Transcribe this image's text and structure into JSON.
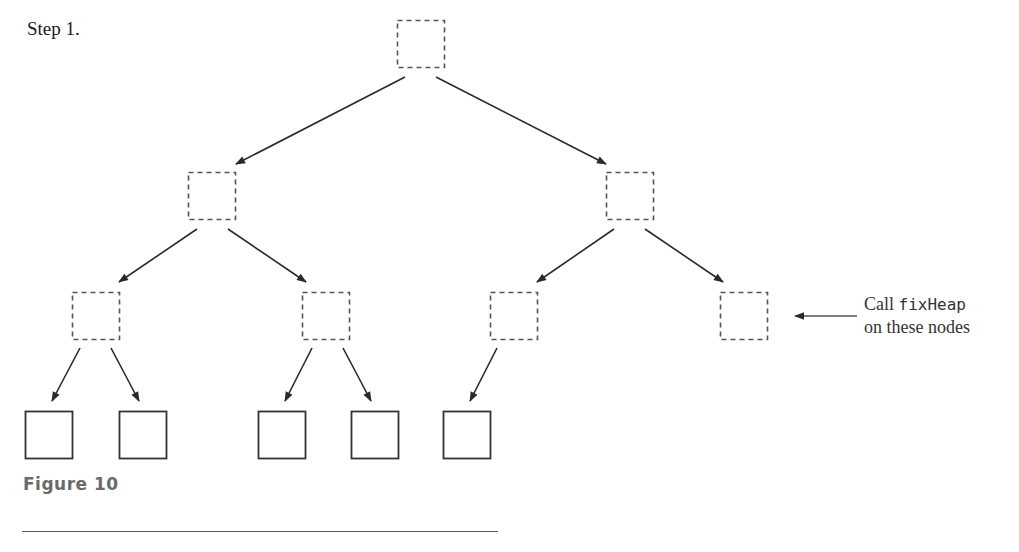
{
  "step": {
    "label": "Step 1."
  },
  "annotation": {
    "line1_prefix": "Call ",
    "line1_code": "fixHeap",
    "line2": "on these nodes"
  },
  "figure": {
    "caption": "Figure 10"
  },
  "colors": {
    "dashed_node_stroke": "#555555",
    "solid_node_stroke": "#333333",
    "arrow": "#2a2a2a",
    "caption_text": "#6a6a6a"
  },
  "tree": {
    "node_size": 47,
    "nodes": [
      {
        "id": "n1",
        "level": 1,
        "x": 397,
        "y": 20,
        "style": "dashed"
      },
      {
        "id": "n2",
        "level": 2,
        "x": 188,
        "y": 172,
        "style": "dashed"
      },
      {
        "id": "n3",
        "level": 2,
        "x": 606,
        "y": 172,
        "style": "dashed"
      },
      {
        "id": "n4",
        "level": 3,
        "x": 72,
        "y": 292,
        "style": "dashed"
      },
      {
        "id": "n5",
        "level": 3,
        "x": 302,
        "y": 292,
        "style": "dashed"
      },
      {
        "id": "n6",
        "level": 3,
        "x": 490,
        "y": 292,
        "style": "dashed"
      },
      {
        "id": "n7",
        "level": 3,
        "x": 720,
        "y": 292,
        "style": "dashed"
      },
      {
        "id": "n8",
        "level": 4,
        "x": 25,
        "y": 411,
        "style": "solid"
      },
      {
        "id": "n9",
        "level": 4,
        "x": 119,
        "y": 411,
        "style": "solid"
      },
      {
        "id": "n10",
        "level": 4,
        "x": 258,
        "y": 411,
        "style": "solid"
      },
      {
        "id": "n11",
        "level": 4,
        "x": 351,
        "y": 411,
        "style": "solid"
      },
      {
        "id": "n12",
        "level": 4,
        "x": 443,
        "y": 411,
        "style": "solid"
      }
    ],
    "edges": [
      {
        "from": "n1",
        "to": "n2",
        "x1": 405,
        "y1": 77,
        "x2": 236,
        "y2": 164
      },
      {
        "from": "n1",
        "to": "n3",
        "x1": 436,
        "y1": 77,
        "x2": 606,
        "y2": 164
      },
      {
        "from": "n2",
        "to": "n4",
        "x1": 197,
        "y1": 229,
        "x2": 119,
        "y2": 282
      },
      {
        "from": "n2",
        "to": "n5",
        "x1": 228,
        "y1": 229,
        "x2": 306,
        "y2": 282
      },
      {
        "from": "n3",
        "to": "n6",
        "x1": 614,
        "y1": 229,
        "x2": 537,
        "y2": 282
      },
      {
        "from": "n3",
        "to": "n7",
        "x1": 645,
        "y1": 229,
        "x2": 723,
        "y2": 282
      },
      {
        "from": "n4",
        "to": "n8",
        "x1": 80,
        "y1": 348,
        "x2": 52,
        "y2": 401
      },
      {
        "from": "n4",
        "to": "n9",
        "x1": 111,
        "y1": 348,
        "x2": 139,
        "y2": 401
      },
      {
        "from": "n5",
        "to": "n10",
        "x1": 312,
        "y1": 348,
        "x2": 285,
        "y2": 401
      },
      {
        "from": "n5",
        "to": "n11",
        "x1": 343,
        "y1": 348,
        "x2": 371,
        "y2": 401
      },
      {
        "from": "n6",
        "to": "n12",
        "x1": 497,
        "y1": 348,
        "x2": 470,
        "y2": 401
      }
    ],
    "annotation_arrow": {
      "x1": 857,
      "y1": 316,
      "x2": 795,
      "y2": 316
    }
  }
}
